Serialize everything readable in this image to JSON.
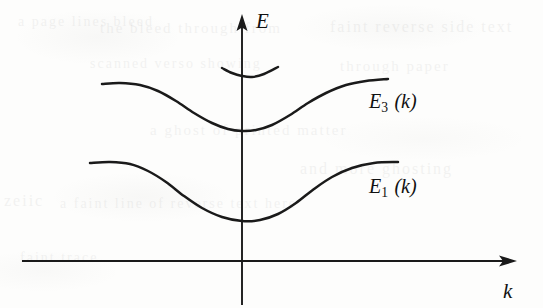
{
  "figure": {
    "background_color": "#fdfdfc",
    "ink_color": "#1a1a1a",
    "axes": {
      "vertical": {
        "label": "E",
        "name": "energy-axis",
        "x": 242,
        "y_top": 16,
        "y_bottom": 305,
        "arrow": "up"
      },
      "horizontal": {
        "label": "k",
        "name": "wavevector-axis",
        "y": 261,
        "x_left": 22,
        "x_right": 515,
        "arrow": "right"
      }
    },
    "curves": [
      {
        "id": "band-3",
        "label_main": "E",
        "label_sub": "3",
        "label_arg": "(k)",
        "label_text": "E3 (k)",
        "description": "upper conduction band, minimum at k = 0",
        "minimum_k": 0,
        "points": [
          [
            102,
            84
          ],
          [
            120,
            83
          ],
          [
            140,
            85
          ],
          [
            158,
            91
          ],
          [
            176,
            101
          ],
          [
            194,
            113
          ],
          [
            212,
            123
          ],
          [
            228,
            129
          ],
          [
            242,
            131
          ],
          [
            256,
            130
          ],
          [
            272,
            125
          ],
          [
            290,
            115
          ],
          [
            308,
            103
          ],
          [
            326,
            93
          ],
          [
            346,
            85
          ],
          [
            366,
            81
          ],
          [
            388,
            79
          ]
        ]
      },
      {
        "id": "band-1",
        "label_main": "E",
        "label_sub": "1",
        "label_arg": "(k)",
        "label_text": "E1 (k)",
        "description": "lower valence band, minimum at k = 0",
        "minimum_k": 0,
        "points": [
          [
            90,
            163
          ],
          [
            110,
            162
          ],
          [
            130,
            164
          ],
          [
            148,
            171
          ],
          [
            166,
            182
          ],
          [
            184,
            196
          ],
          [
            202,
            208
          ],
          [
            222,
            217
          ],
          [
            242,
            221
          ],
          [
            260,
            220
          ],
          [
            278,
            214
          ],
          [
            296,
            203
          ],
          [
            314,
            189
          ],
          [
            332,
            177
          ],
          [
            352,
            168
          ],
          [
            374,
            163
          ],
          [
            398,
            162
          ]
        ]
      },
      {
        "id": "band-upper-fragment",
        "label_text": "",
        "description": "bottom of a higher band, partial arc crossing E axis",
        "points": [
          [
            222,
            68
          ],
          [
            232,
            73
          ],
          [
            242,
            76
          ],
          [
            252,
            77
          ],
          [
            264,
            74
          ],
          [
            278,
            67
          ]
        ]
      }
    ],
    "ghost_text": [
      {
        "text": "a page lines bleed",
        "x": 18,
        "y": 14
      },
      {
        "text": "the bleed through from",
        "x": 100,
        "y": 20
      },
      {
        "text": "faint reverse side text",
        "x": 330,
        "y": 18
      },
      {
        "text": "scanned verso showing",
        "x": 90,
        "y": 56
      },
      {
        "text": "through paper",
        "x": 340,
        "y": 58
      },
      {
        "text": "zeiic",
        "x": 4,
        "y": 192
      },
      {
        "text": "a faint line of reverse text here",
        "x": 60,
        "y": 196
      },
      {
        "text": "a ghost of printed matter",
        "x": 150,
        "y": 122
      },
      {
        "text": "and more ghosting",
        "x": 300,
        "y": 160
      },
      {
        "text": "faint trace",
        "x": 20,
        "y": 250
      }
    ]
  }
}
